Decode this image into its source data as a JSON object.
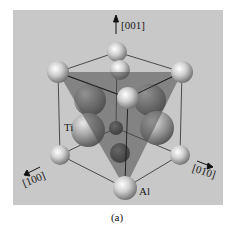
{
  "figure": {
    "caption": "(a)",
    "labels": {
      "axis_001": "[001]",
      "axis_100": "[100]",
      "axis_010": "[010]",
      "atom_ti": "Ti",
      "atom_al": "Al"
    },
    "colors": {
      "panel_background": "#c8c8c8",
      "plane_fill": "#6f6f6f",
      "edge_color": "#2a2a2a",
      "sphere_light": "#f2f2f2",
      "sphere_dark": "#5a5a5a"
    }
  }
}
